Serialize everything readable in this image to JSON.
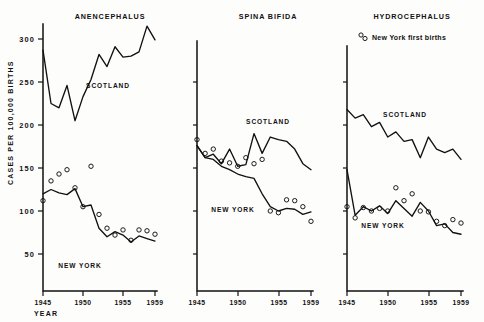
{
  "figure": {
    "yaxis_title": "CASES PER 100,000 BIRTHS",
    "xaxis_title": "YEAR",
    "legend_label": "New York first births",
    "legend_marker": "open-circle"
  },
  "labels": {
    "scotland": "SCOTLAND",
    "new_york": "NEW YORK"
  },
  "ticks": {
    "y": [
      "50",
      "100",
      "150",
      "200",
      "250",
      "300"
    ],
    "x": [
      "1945",
      "1950",
      "1955",
      "1959"
    ]
  },
  "chart_data": {
    "type": "line",
    "xlabel": "YEAR",
    "ylabel": "CASES PER 100,000 BIRTHS",
    "ylim": [
      0,
      320
    ],
    "yticks": [
      50,
      100,
      150,
      200,
      250,
      300
    ],
    "xlim": [
      1945,
      1959
    ],
    "xticks": [
      1945,
      1950,
      1955,
      1959
    ],
    "grid": false,
    "legend": {
      "position": "top-right",
      "entries": [
        {
          "name": "New York first births",
          "marker": "open-circle",
          "line": false
        }
      ]
    },
    "panels": [
      {
        "title": "ANENCEPHALUS",
        "x": [
          1945,
          1946,
          1947,
          1948,
          1949,
          1950,
          1951,
          1952,
          1953,
          1954,
          1955,
          1956,
          1957,
          1958,
          1959
        ],
        "series": [
          {
            "name": "SCOTLAND",
            "style": "line",
            "values": [
              287,
              225,
              220,
              246,
              205,
              233,
              253,
              282,
              268,
              291,
              279,
              280,
              285,
              315,
              299
            ]
          },
          {
            "name": "NEW YORK",
            "style": "line",
            "values": [
              120,
              125,
              121,
              119,
              126,
              105,
              107,
              80,
              70,
              76,
              72,
              64,
              71,
              68,
              65
            ]
          },
          {
            "name": "New York first births",
            "style": "markers",
            "values": [
              112,
              135,
              143,
              148,
              127,
              105,
              152,
              96,
              80,
              72,
              78,
              66,
              78,
              77,
              73
            ]
          }
        ]
      },
      {
        "title": "SPINA BIFIDA",
        "x": [
          1945,
          1946,
          1947,
          1948,
          1949,
          1950,
          1951,
          1952,
          1953,
          1954,
          1955,
          1956,
          1957,
          1958,
          1959
        ],
        "series": [
          {
            "name": "SCOTLAND",
            "style": "line",
            "values": [
              176,
              162,
              166,
              155,
              172,
              152,
              154,
              190,
              167,
              186,
              183,
              181,
              172,
              155,
              148
            ]
          },
          {
            "name": "NEW YORK",
            "style": "line",
            "values": [
              176,
              162,
              160,
              152,
              148,
              143,
              140,
              138,
              120,
              105,
              100,
              103,
              102,
              96,
              99
            ]
          },
          {
            "name": "New York first births",
            "style": "markers",
            "values": [
              183,
              167,
              172,
              158,
              156,
              152,
              162,
              155,
              160,
              100,
              98,
              113,
              112,
              105,
              88
            ]
          }
        ]
      },
      {
        "title": "HYDROCEPHALUS",
        "x": [
          1945,
          1946,
          1947,
          1948,
          1949,
          1950,
          1951,
          1952,
          1953,
          1954,
          1955,
          1956,
          1957,
          1958,
          1959
        ],
        "series": [
          {
            "name": "SCOTLAND",
            "style": "line",
            "values": [
              218,
              208,
              212,
              198,
              203,
              186,
              192,
              181,
              183,
              162,
              186,
              172,
              168,
              172,
              160
            ]
          },
          {
            "name": "NEW YORK",
            "style": "line",
            "values": [
              148,
              95,
              105,
              100,
              106,
              97,
              112,
              103,
              94,
              110,
              100,
              83,
              85,
              75,
              73
            ]
          },
          {
            "name": "New York first births",
            "style": "markers",
            "values": [
              105,
              92,
              104,
              100,
              103,
              100,
              127,
              112,
              120,
              100,
              99,
              88,
              83,
              90,
              86
            ]
          }
        ]
      }
    ]
  }
}
